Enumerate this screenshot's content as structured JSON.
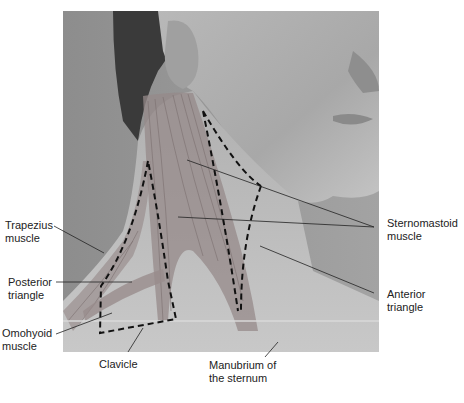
{
  "figure": {
    "labels": {
      "trapezius": "Trapezius\nmuscle",
      "posterior_triangle": "Posterior\ntriangle",
      "omohyoid": "Omohyoid\nmuscle",
      "clavicle": "Clavicle",
      "manubrium": "Manubrium of\nthe sternum",
      "sternomastoid": "Sternomastoid\nmuscle",
      "anterior_triangle": "Anterior\ntriangle"
    }
  }
}
